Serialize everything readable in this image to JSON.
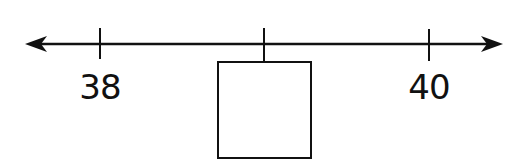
{
  "diagram": {
    "type": "number-line",
    "colors": {
      "line": "#111111",
      "background": "#ffffff"
    },
    "line": {
      "y": 44,
      "x_start": 25,
      "x_end": 503,
      "arrows": "both"
    },
    "ticks": [
      {
        "x": 100,
        "value": "38",
        "label": "38",
        "label_x": 100,
        "label_y": 70
      },
      {
        "x": 264,
        "value": "?",
        "label": "",
        "is_blank": true
      },
      {
        "x": 429,
        "value": "40",
        "label": "40",
        "label_x": 429,
        "label_y": 70
      }
    ],
    "answer_box": {
      "x": 217,
      "y": 61,
      "width": 94,
      "height": 97,
      "content": ""
    }
  }
}
